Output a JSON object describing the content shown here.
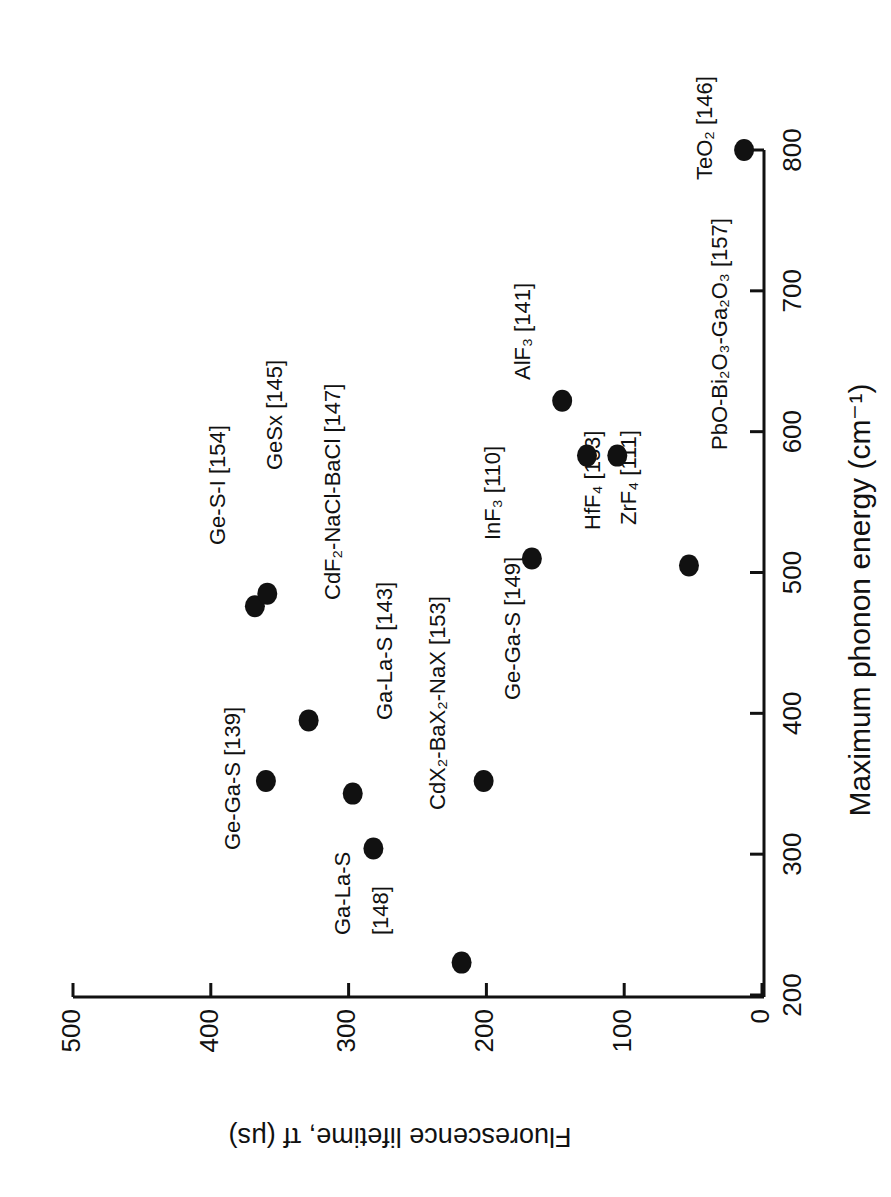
{
  "chart_data": {
    "type": "scatter",
    "title": "",
    "xlabel": "Maximum phonon energy (cm⁻¹)",
    "ylabel": "Fluorescence lifetime, τf (μs)",
    "xlim": [
      200,
      800
    ],
    "ylim": [
      0,
      500
    ],
    "xticks": [
      200,
      300,
      400,
      500,
      600,
      700,
      800
    ],
    "yticks": [
      0,
      100,
      200,
      300,
      400,
      500
    ],
    "grid": false,
    "legend": "none",
    "orientation_note": "figure rotated 90deg counterclockwise on page",
    "points": [
      {
        "label": "TeO₂ [146]",
        "x": 800,
        "y": 13
      },
      {
        "label": "PbO-Bi₂O₃-Ga₂O₃ [157]",
        "x": 505,
        "y": 53
      },
      {
        "label": "ZrF₄ [111]",
        "x": 583,
        "y": 105
      },
      {
        "label": "HfF₄ [153]",
        "x": 583,
        "y": 127
      },
      {
        "label": "AlF₃ [141]",
        "x": 622,
        "y": 145
      },
      {
        "label": "InF₃ [110]",
        "x": 510,
        "y": 167
      },
      {
        "label": "Ge-Ga-S [149]",
        "x": 352,
        "y": 202
      },
      {
        "label": "CdX₂-BaX₂-NaX [153]",
        "x": 223,
        "y": 218
      },
      {
        "label": "Ga-La-S [148]",
        "x": 304,
        "y": 282
      },
      {
        "label": "Ga-La-S [143]",
        "x": 343,
        "y": 297
      },
      {
        "label": "CdF₂-NaCl-BaCl [147]",
        "x": 395,
        "y": 329
      },
      {
        "label": "Ge-Ga-S [139]",
        "x": 352,
        "y": 360
      },
      {
        "label": "Ge-S-I [154]",
        "x": 476,
        "y": 368
      },
      {
        "label": "GeSx [145]",
        "x": 485,
        "y": 359
      }
    ]
  },
  "axis_labels": {
    "x": "Maximum phonon energy (cm⁻¹)",
    "y": "Fluorescence lifetime,  τf (μs)"
  },
  "point_labels": [
    {
      "text": "TeO₂ [146]",
      "px": 712,
      "py": 180
    },
    {
      "text": "PbO-Bi₂O₃-Ga₂O₃ [157]",
      "px": 727,
      "py": 450
    },
    {
      "text": "ZrF₄ [111]",
      "px": 636,
      "py": 525
    },
    {
      "text": "HfF₄ [153]",
      "px": 600,
      "py": 530
    },
    {
      "text": "AlF₃ [141]",
      "px": 530,
      "py": 380
    },
    {
      "text": "InF₃ [110]",
      "px": 500,
      "py": 540
    },
    {
      "text": "Ge-Ga-S [149]",
      "px": 520,
      "py": 700
    },
    {
      "text": "CdX₂-BaX₂-NaX [153]",
      "px": 445,
      "py": 810
    },
    {
      "text": "Ga-La-S",
      "px": 350,
      "py": 935
    },
    {
      "text": "[148]",
      "px": 388,
      "py": 935
    },
    {
      "text": "Ga-La-S [143]",
      "px": 392,
      "py": 720
    },
    {
      "text": "CdF₂-NaCl-BaCl [147]",
      "px": 340,
      "py": 600
    },
    {
      "text": "Ge-Ga-S [139]",
      "px": 240,
      "py": 850
    },
    {
      "text": "Ge-S-I [154]",
      "px": 225,
      "py": 545
    },
    {
      "text": "GeSx [145]",
      "px": 282,
      "py": 470
    }
  ]
}
